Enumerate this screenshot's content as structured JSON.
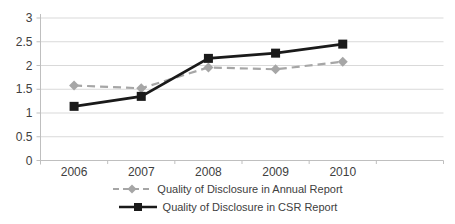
{
  "chart_data": {
    "type": "line",
    "title": "",
    "xlabel": "",
    "ylabel": "",
    "categories": [
      "2006",
      "2007",
      "2008",
      "2009",
      "2010"
    ],
    "series": [
      {
        "name": "Quality of Disclosure in Annual Report",
        "values": [
          1.58,
          1.52,
          1.96,
          1.92,
          2.08
        ],
        "color": "#a6a6a6",
        "marker": "diamond",
        "line_style": "dashed"
      },
      {
        "name": "Quality of Disclosure in CSR Report",
        "values": [
          1.14,
          1.35,
          2.15,
          2.26,
          2.45
        ],
        "color": "#1a1a1a",
        "marker": "square",
        "line_style": "solid"
      }
    ],
    "ylim": [
      0,
      3
    ],
    "yticks": [
      0,
      0.5,
      1,
      1.5,
      2,
      2.5,
      3
    ],
    "grid": true,
    "legend_position": "bottom-center",
    "gridline_color": "#d9d9d9",
    "axis_color": "#bfbfbf",
    "text_color": "#404040",
    "background_color": "#ffffff"
  }
}
